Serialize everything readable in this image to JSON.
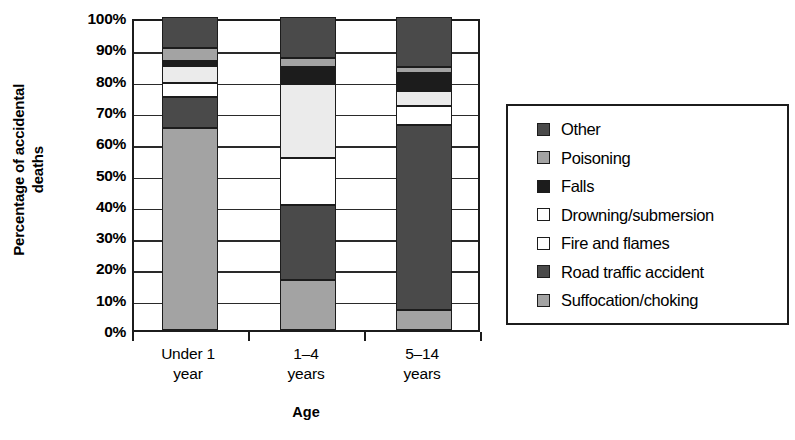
{
  "chart_data": {
    "type": "bar",
    "subtype": "stacked-bar-percent",
    "title": "",
    "xlabel": "Age",
    "ylabel": "Percentage of accidental deaths",
    "ylabel_line1": "Percentage of accidental",
    "ylabel_line2": "deaths",
    "categories": [
      "Under 1 year",
      "1–4 years",
      "5–14 years"
    ],
    "category_lines": [
      [
        "Under 1",
        "year"
      ],
      [
        "1–4",
        "years"
      ],
      [
        "5–14",
        "years"
      ]
    ],
    "ylim": [
      0,
      100
    ],
    "ytick_labels": [
      "0%",
      "10%",
      "20%",
      "30%",
      "40%",
      "50%",
      "60%",
      "70%",
      "80%",
      "90%",
      "100%"
    ],
    "ytick_values": [
      0,
      10,
      20,
      30,
      40,
      50,
      60,
      70,
      80,
      90,
      100
    ],
    "grid": true,
    "legend_position": "right",
    "series": [
      {
        "name": "Suffocation/choking",
        "color": "#a3a3a3",
        "values": [
          64.5,
          16.0,
          6.5
        ]
      },
      {
        "name": "Road traffic accident",
        "color": "#4a4a4a",
        "values": [
          10.0,
          24.0,
          59.0
        ]
      },
      {
        "name": "Fire and flames",
        "color": "#ffffff",
        "values": [
          4.5,
          15.0,
          6.0
        ]
      },
      {
        "name": "Drowning/submersion",
        "color": "#ebebeb",
        "values": [
          5.5,
          23.5,
          5.0
        ]
      },
      {
        "name": "Falls",
        "color": "#1c1c1c",
        "values": [
          1.5,
          5.5,
          5.5
        ]
      },
      {
        "name": "Poisoning",
        "color": "#a3a3a3",
        "values": [
          4.0,
          3.0,
          2.0
        ]
      },
      {
        "name": "Other",
        "color": "#4a4a4a",
        "values": [
          10.0,
          13.0,
          16.0
        ]
      }
    ],
    "legend_entries": [
      {
        "label": "Other",
        "color": "#4a4a4a"
      },
      {
        "label": "Poisoning",
        "color": "#a3a3a3"
      },
      {
        "label": "Falls",
        "color": "#1c1c1c"
      },
      {
        "label": "Drowning/submersion",
        "color": "#ffffff"
      },
      {
        "label": "Fire and flames",
        "color": "#ffffff"
      },
      {
        "label": "Road traffic accident",
        "color": "#4a4a4a"
      },
      {
        "label": "Suffocation/choking",
        "color": "#a3a3a3"
      }
    ],
    "colors": {
      "axis": "#1c1c1c",
      "grid": "#2a2a2a",
      "background": "#ffffff",
      "dark_gray": "#4a4a4a",
      "mid_gray": "#a3a3a3",
      "black": "#1c1c1c",
      "off_white": "#ebebeb",
      "white": "#ffffff"
    }
  }
}
